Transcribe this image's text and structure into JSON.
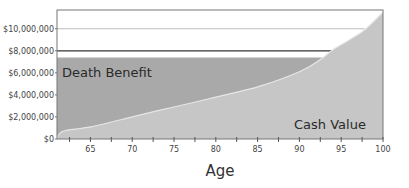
{
  "chart_data": {
    "type": "area",
    "title": "",
    "xlabel": "Age",
    "ylabel": "",
    "xlim": [
      61,
      100
    ],
    "ylim": [
      0,
      11700000
    ],
    "grid": false,
    "legend": "none (labels placed inside areas)",
    "x_ticks": [
      65,
      70,
      75,
      80,
      85,
      90,
      95,
      100
    ],
    "x_minor_ticks": [
      62.5,
      67.5,
      72.5,
      77.5,
      82.5,
      87.5,
      92.5,
      97.5
    ],
    "y_ticks": [
      {
        "value": 0,
        "label": "$0"
      },
      {
        "value": 2000000,
        "label": "$2,000,000"
      },
      {
        "value": 4000000,
        "label": "$4,000,000"
      },
      {
        "value": 6000000,
        "label": "$6,000,000"
      },
      {
        "value": 8000000,
        "label": "$8,000,000"
      },
      {
        "value": 10000000,
        "label": "$10,000,000"
      }
    ],
    "series": [
      {
        "name": "Death Benefit",
        "type": "area",
        "color": "#a9a9a9",
        "x": [
          61,
          100
        ],
        "values": [
          7400000,
          7400000
        ],
        "note": "Flat death benefit band; cash value overtakes it near age 92.5"
      },
      {
        "name": "Cash Value",
        "type": "area",
        "color": "#c6c6c6",
        "x": [
          61,
          61.7,
          65,
          70,
          72.7,
          75,
          80,
          85.3,
          90,
          92.5,
          94,
          96,
          97.8,
          100
        ],
        "values": [
          0,
          700000,
          1100000,
          2000000,
          2500000,
          2900000,
          3800000,
          4800000,
          6100000,
          7200000,
          8100000,
          9000000,
          9900000,
          11500000
        ]
      }
    ],
    "reference_lines": [
      {
        "value": 10000000,
        "color": "#bdbdbd",
        "x_end": 97.8
      },
      {
        "value": 8000000,
        "color": "#333333",
        "x_end": 94
      }
    ],
    "annotations": [
      {
        "text": "Death Benefit",
        "x": 62,
        "y": 6000000
      },
      {
        "text": "Cash Value",
        "x": 93,
        "y": 1200000
      }
    ]
  },
  "labels": {
    "death_benefit": "Death Benefit",
    "cash_value": "Cash Value",
    "x_axis_title": "Age"
  },
  "colors": {
    "death_benefit_fill": "#a9a9a9",
    "cash_value_fill": "#c6c6c6",
    "frame": "#777777",
    "background": "#ffffff"
  }
}
